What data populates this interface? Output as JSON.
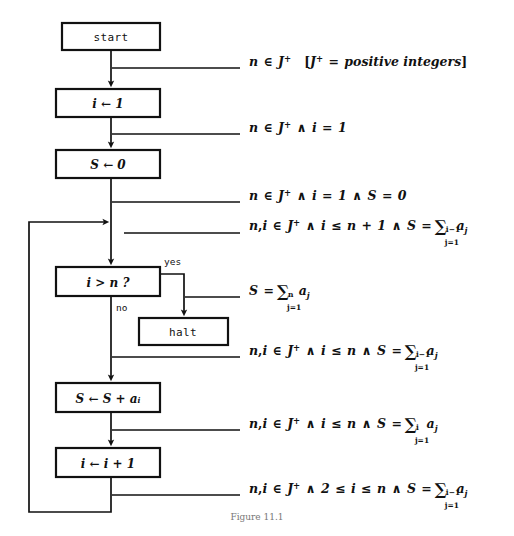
{
  "figure": {
    "domain": "Diagram",
    "type": "flowchart",
    "caption": "Figure 11.1",
    "background_color": "#ffffff",
    "line_color": "#111111",
    "text_color": "#111111"
  },
  "nodes": [
    {
      "id": "start",
      "label": "start",
      "shape": "rectangle",
      "x": 62,
      "y": 23,
      "w": 98,
      "h": 27
    },
    {
      "id": "init_i",
      "label": "i ← 1",
      "shape": "rectangle",
      "x": 56,
      "y": 89,
      "w": 104,
      "h": 28
    },
    {
      "id": "init_s",
      "label": "S ← 0",
      "shape": "rectangle",
      "x": 56,
      "y": 150,
      "w": 104,
      "h": 28
    },
    {
      "id": "test",
      "label": "i > n ?",
      "shape": "rectangle",
      "x": 56,
      "y": 267,
      "w": 104,
      "h": 29
    },
    {
      "id": "halt",
      "label": "halt",
      "shape": "rectangle",
      "x": 139,
      "y": 318,
      "w": 89,
      "h": 27
    },
    {
      "id": "accum",
      "label": "S ← S + aᵢ",
      "shape": "rectangle",
      "x": 56,
      "y": 383,
      "w": 104,
      "h": 29
    },
    {
      "id": "increment",
      "label": "i ← i + 1",
      "shape": "rectangle",
      "x": 56,
      "y": 448,
      "w": 104,
      "h": 29
    }
  ],
  "branch_labels": {
    "yes": "yes",
    "no": "no"
  },
  "annotations": [
    {
      "id": "annot-1",
      "after_node": "start",
      "leader": {
        "x1": 112,
        "y1": 68,
        "x2": 240,
        "y2": 68
      },
      "text_x": 249,
      "text_y": 60,
      "plain": "n ∈ J⁺   [J⁺ = positive integers]"
    },
    {
      "id": "annot-2",
      "after_node": "init_i",
      "leader": {
        "x1": 112,
        "y1": 134,
        "x2": 240,
        "y2": 134
      },
      "text_x": 249,
      "text_y": 126,
      "plain": "n ∈ J⁺ ∧ i = 1"
    },
    {
      "id": "annot-3",
      "after_node": "init_s",
      "leader": {
        "x1": 112,
        "y1": 202,
        "x2": 240,
        "y2": 202
      },
      "text_x": 249,
      "text_y": 194,
      "plain": "n ∈ J⁺ ∧ i = 1 ∧ S = 0"
    },
    {
      "id": "annot-4",
      "after_node": "loop-entry",
      "leader": {
        "x1": 124,
        "y1": 233,
        "x2": 240,
        "y2": 233
      },
      "text_x": 249,
      "text_y": 222,
      "plain": "n, i ∈ J⁺ ∧ i ≤ n + 1 ∧ S = ∑_{j=1}^{i−1} a_j"
    },
    {
      "id": "annot-5",
      "after_node": "test-yes",
      "leader": {
        "x1": 185,
        "y1": 297,
        "x2": 240,
        "y2": 297
      },
      "text_x": 249,
      "text_y": 287,
      "plain": "S = ∑_{j=1}^{n} a_j"
    },
    {
      "id": "annot-6",
      "after_node": "test-no",
      "leader": {
        "x1": 112,
        "y1": 357,
        "x2": 240,
        "y2": 357
      },
      "text_x": 249,
      "text_y": 346,
      "plain": "n, i ∈ J⁺ ∧ i ≤ n ∧ S = ∑_{j=1}^{i−1} a_j"
    },
    {
      "id": "annot-7",
      "after_node": "accum",
      "leader": {
        "x1": 112,
        "y1": 430,
        "x2": 240,
        "y2": 430
      },
      "text_x": 249,
      "text_y": 419,
      "plain": "n, i ∈ J⁺ ∧ i ≤ n ∧ S = ∑_{j=1}^{i} a_j"
    },
    {
      "id": "annot-8",
      "after_node": "increment",
      "leader": {
        "x1": 112,
        "y1": 495,
        "x2": 240,
        "y2": 495
      },
      "text_x": 249,
      "text_y": 484,
      "plain": "n, i ∈ J⁺ ∧ 2 ≤ i ≤ n ∧ S = ∑_{j=1}^{i−1} a_j"
    }
  ],
  "edges": [
    {
      "id": "e-start-init_i",
      "from": "start",
      "to": "init_i",
      "kind": "down-arrow"
    },
    {
      "id": "e-init_i-init_s",
      "from": "init_i",
      "to": "init_s",
      "kind": "down-arrow"
    },
    {
      "id": "e-init_s-test",
      "from": "init_s",
      "to": "test",
      "kind": "down-arrow"
    },
    {
      "id": "e-test-halt",
      "from": "test",
      "to": "halt",
      "kind": "right-down-arrow",
      "label": "yes"
    },
    {
      "id": "e-test-accum",
      "from": "test",
      "to": "accum",
      "kind": "down-arrow",
      "label": "no"
    },
    {
      "id": "e-accum-increment",
      "from": "accum",
      "to": "increment",
      "kind": "down-arrow"
    },
    {
      "id": "e-loop-back",
      "from": "increment",
      "to": "test",
      "kind": "loop-left-up-arrow"
    }
  ]
}
